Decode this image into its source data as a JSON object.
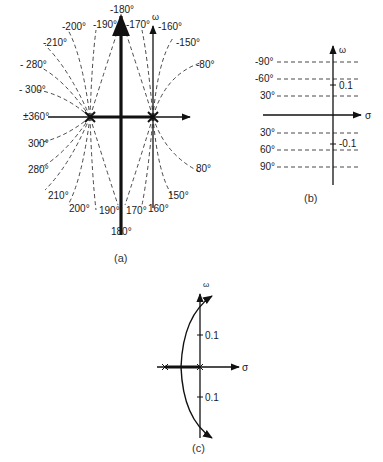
{
  "figure_a": {
    "caption": "(a)",
    "axis_labels": {
      "omega": "ω"
    },
    "upper_labels": {
      "m180": "-180°",
      "m190": "-190°",
      "m170": "-170°",
      "m200": "-200°",
      "m160": "-160°",
      "m210": "-210°",
      "m150": "-150°",
      "m280": "- 280°",
      "m80": "-80°",
      "m300": "- 300°",
      "pm360": "±360°"
    },
    "lower_labels": {
      "p300": "300°",
      "p280": "280°",
      "p210": "210°",
      "p200": "200°",
      "p190": "190°",
      "p170": "170°",
      "p160": "160°",
      "p150": "150°",
      "p80": "80°",
      "p180": "180°"
    }
  },
  "figure_b": {
    "caption": "(b)",
    "axis_labels": {
      "omega": "ω",
      "sigma": "σ"
    },
    "lines": [
      {
        "label": "-90°"
      },
      {
        "label": "-60°"
      },
      {
        "label": "30°"
      },
      {
        "label": "30°"
      },
      {
        "label": "60°"
      },
      {
        "label": "90°"
      }
    ],
    "ticks": {
      "upper": "0.1",
      "lower": "-0.1"
    }
  },
  "figure_c": {
    "caption": "(c)",
    "axis_labels": {
      "omega": "ω",
      "sigma": "σ"
    },
    "ticks": {
      "upper": "0.1",
      "lower": "0.1"
    }
  }
}
